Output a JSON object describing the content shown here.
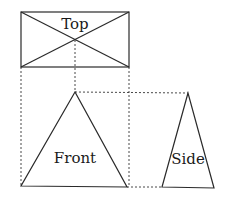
{
  "diagram": {
    "views": {
      "top": {
        "label": "Top"
      },
      "front": {
        "label": "Front"
      },
      "side": {
        "label": "Side"
      }
    },
    "colors": {
      "line": "#2a2a2a",
      "background": "#ffffff"
    }
  }
}
